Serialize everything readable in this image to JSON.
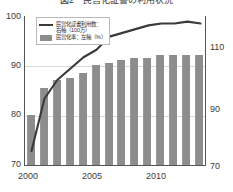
{
  "figure": {
    "title": "図2　民営化証書の利用状況"
  },
  "legend": {
    "position": "top-left",
    "entries": [
      {
        "marker": "line",
        "label": "民営化証書利用数：\n右軸（100万）"
      },
      {
        "marker": "bar",
        "label": "民営化率：左軸（%）"
      }
    ]
  },
  "axes": {
    "left": {
      "label": "",
      "ticks": [
        "100",
        "90",
        "80",
        "70"
      ],
      "min": 70,
      "max": 100
    },
    "right": {
      "label": "",
      "ticks": [
        "110",
        "90",
        "70"
      ],
      "min": 70,
      "max": 110
    },
    "x": {
      "label": "",
      "ticks": [
        "2000",
        "2005",
        "2010"
      ]
    }
  },
  "colors": {
    "bar": "#8d8d8d",
    "line": "#3a3a3a",
    "grid": "#d8d8d8",
    "frame": "#555555",
    "text": "#2b2b2b"
  },
  "chart_data": {
    "type": "bar",
    "title": "図2　民営化証書の利用状況",
    "xlabel": "",
    "ylabel": "民営化率（%）",
    "y2label": "民営化証書利用数（100万）",
    "grid": true,
    "legend_position": "top-left",
    "categories": [
      "2000",
      "2001",
      "2002",
      "2003",
      "2004",
      "2005",
      "2006",
      "2007",
      "2008",
      "2009",
      "2010",
      "2011",
      "2012",
      "2013"
    ],
    "ylim": [
      70,
      100
    ],
    "y2lim": [
      70,
      110
    ],
    "series": [
      {
        "name": "民営化率：左軸（%）",
        "type": "bar",
        "axis": "left",
        "unit": "%",
        "values": [
          80.0,
          85.5,
          87.0,
          87.5,
          88.5,
          90.0,
          90.5,
          91.0,
          91.5,
          91.5,
          92.0,
          92.0,
          92.0,
          92.0
        ]
      },
      {
        "name": "民営化証書利用数：右軸（100万）",
        "type": "line",
        "axis": "right",
        "unit": "100万",
        "values": [
          74.0,
          88.0,
          93.0,
          96.0,
          99.0,
          101.0,
          104.5,
          105.5,
          106.5,
          107.5,
          108.0,
          108.0,
          108.5,
          108.0
        ]
      }
    ]
  }
}
